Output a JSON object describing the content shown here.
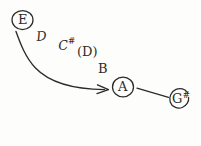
{
  "diagram": {
    "medium": "hand-drawn pencil sketch",
    "ink_color": "#2b2b2b",
    "background_color": "#fdfdfc",
    "notes": [
      {
        "id": "e",
        "label": "E",
        "circled": true,
        "accidental": "",
        "role": "start-note",
        "x": 22,
        "y": 20
      },
      {
        "id": "d1",
        "label": "D",
        "circled": false,
        "accidental": "",
        "role": "passing-tone",
        "x": 42,
        "y": 36
      },
      {
        "id": "csharp",
        "label": "C",
        "circled": false,
        "accidental": "#",
        "role": "passing-tone",
        "x": 65,
        "y": 45
      },
      {
        "id": "d2",
        "label": "(D)",
        "circled": false,
        "accidental": "",
        "role": "optional-passing-tone",
        "x": 90,
        "y": 53
      },
      {
        "id": "b",
        "label": "B",
        "circled": false,
        "accidental": "",
        "role": "passing-tone",
        "x": 104,
        "y": 70
      },
      {
        "id": "a",
        "label": "A",
        "circled": true,
        "accidental": "",
        "role": "target-note",
        "x": 123,
        "y": 87
      },
      {
        "id": "gsharp",
        "label": "G",
        "circled": true,
        "accidental": "#",
        "role": "end-note",
        "x": 179,
        "y": 98
      }
    ],
    "connectors": [
      {
        "id": "curved-arrow",
        "kind": "curved-arrow",
        "from": "e",
        "to": "a",
        "arrowhead": true,
        "description": "long sweeping curve from E down to A"
      },
      {
        "id": "straight-line",
        "kind": "straight-line",
        "from": "a",
        "to": "gsharp",
        "arrowhead": false,
        "description": "short straight stroke from A to G-sharp"
      }
    ]
  }
}
